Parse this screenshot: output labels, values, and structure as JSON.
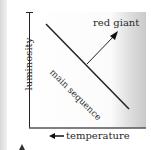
{
  "diagram": {
    "type": "Hertzsprung-Russell sketch",
    "y_axis_label": "luminosity",
    "x_axis_label": "temperature",
    "x_axis_direction": "left (decreasing temperature to the right)",
    "main_sequence_label": "main sequence",
    "red_giant_label": "red giant"
  }
}
